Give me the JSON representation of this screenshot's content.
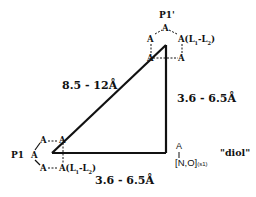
{
  "diagram": {
    "edges": {
      "hypotenuse": "8.5 - 12Å",
      "vertical": "3.6 - 6.5Å",
      "horizontal": "3.6 - 6.5Å"
    },
    "p1_prime": {
      "label": "P1'",
      "top_atom": "A",
      "left_atom": "A",
      "right_atom": "A",
      "right_suffix": "(L",
      "right_sub1": "1",
      "right_mid": "-L",
      "right_sub2": "2",
      "right_close": ")",
      "lower_right_atom": "A",
      "lower_left_atom": "A"
    },
    "p1": {
      "label": "P1",
      "upper_left_atom": "A",
      "upper_right_atom": "A",
      "left_atom": "A",
      "lower_left_atom": "A",
      "lower_right_atom": "A",
      "lower_suffix": "(L",
      "lower_sub1": "1",
      "lower_mid": "-L",
      "lower_sub2": "2",
      "lower_close": ")"
    },
    "corner": {
      "atom": "A",
      "group": "[N,O]",
      "group_sub": "(s1)",
      "name": "\"diol\""
    }
  }
}
